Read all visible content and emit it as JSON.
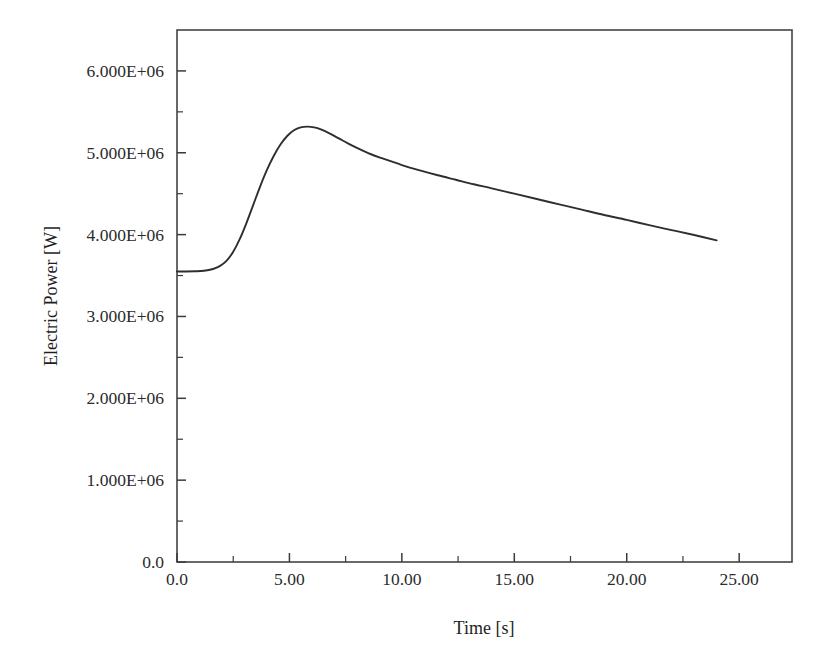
{
  "chart_data": {
    "type": "line",
    "title": "",
    "xlabel": "Time [s]",
    "ylabel": "Electric Power [W]",
    "xlim": [
      0,
      27.35
    ],
    "ylim": [
      0,
      6500000
    ],
    "grid": false,
    "legend": null,
    "x_ticks": [
      {
        "value": 0,
        "label": "0.0",
        "major": true
      },
      {
        "value": 2.5,
        "label": "",
        "major": false
      },
      {
        "value": 5,
        "label": "5.00",
        "major": true
      },
      {
        "value": 7.5,
        "label": "",
        "major": false
      },
      {
        "value": 10,
        "label": "10.00",
        "major": true
      },
      {
        "value": 12.5,
        "label": "",
        "major": false
      },
      {
        "value": 15,
        "label": "15.00",
        "major": true
      },
      {
        "value": 17.5,
        "label": "",
        "major": false
      },
      {
        "value": 20,
        "label": "20.00",
        "major": true
      },
      {
        "value": 22.5,
        "label": "",
        "major": false
      },
      {
        "value": 25,
        "label": "25.00",
        "major": true
      }
    ],
    "y_ticks": [
      {
        "value": 0,
        "label": "0.0",
        "major": true
      },
      {
        "value": 500000,
        "label": "",
        "major": false
      },
      {
        "value": 1000000,
        "label": "1.000E+06",
        "major": true
      },
      {
        "value": 1500000,
        "label": "",
        "major": false
      },
      {
        "value": 2000000,
        "label": "2.000E+06",
        "major": true
      },
      {
        "value": 2500000,
        "label": "",
        "major": false
      },
      {
        "value": 3000000,
        "label": "3.000E+06",
        "major": true
      },
      {
        "value": 3500000,
        "label": "",
        "major": false
      },
      {
        "value": 4000000,
        "label": "4.000E+06",
        "major": true
      },
      {
        "value": 4500000,
        "label": "",
        "major": false
      },
      {
        "value": 5000000,
        "label": "5.000E+06",
        "major": true
      },
      {
        "value": 5500000,
        "label": "",
        "major": false
      },
      {
        "value": 6000000,
        "label": "6.000E+06",
        "major": true
      }
    ],
    "series": [
      {
        "name": "Electric Power",
        "color": "#2e2e2e",
        "x": [
          0.0,
          0.4,
          0.8,
          1.2,
          1.6,
          1.9,
          2.2,
          2.5,
          2.8,
          3.1,
          3.4,
          3.7,
          4.0,
          4.3,
          4.6,
          4.9,
          5.2,
          5.5,
          5.8,
          6.1,
          6.4,
          6.8,
          7.2,
          7.6,
          8.0,
          8.6,
          9.2,
          10.0,
          10.8,
          11.6,
          12.4,
          13.2,
          14.0,
          15.0,
          16.0,
          17.0,
          18.0,
          19.0,
          20.0,
          21.0,
          22.0,
          23.0,
          24.0
        ],
        "y": [
          3550000,
          3550000,
          3552000,
          3558000,
          3580000,
          3615000,
          3680000,
          3790000,
          3950000,
          4150000,
          4370000,
          4590000,
          4790000,
          4960000,
          5100000,
          5205000,
          5275000,
          5310000,
          5320000,
          5310000,
          5285000,
          5235000,
          5175000,
          5115000,
          5060000,
          4985000,
          4925000,
          4850000,
          4785000,
          4725000,
          4670000,
          4615000,
          4565000,
          4500000,
          4435000,
          4370000,
          4305000,
          4240000,
          4180000,
          4115000,
          4055000,
          3995000,
          3930000
        ]
      }
    ],
    "annotations": {
      "initial_value": 3550000,
      "peak_value": 5320000,
      "peak_time": 5.8,
      "final_value": 3930000,
      "final_time": 24.0
    }
  },
  "layout": {
    "plot_left_px": 177,
    "plot_right_px": 792,
    "plot_top_px": 30,
    "plot_bottom_px": 562,
    "background_color": "#ffffff",
    "axis_color": "#444444",
    "curve_color": "#2e2e2e"
  }
}
